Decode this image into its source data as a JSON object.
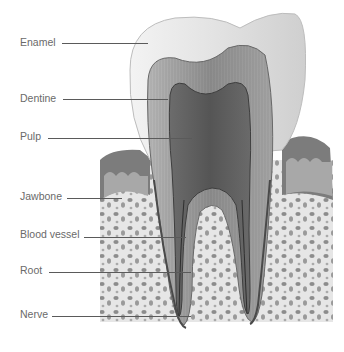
{
  "diagram": {
    "labels": [
      {
        "text": "Enamel",
        "x": 20,
        "y": 36,
        "line_x1": 62,
        "line_x2": 148,
        "line_y": 43
      },
      {
        "text": "Dentine",
        "x": 20,
        "y": 92,
        "line_x1": 63,
        "line_x2": 168,
        "line_y": 99
      },
      {
        "text": "Pulp",
        "x": 20,
        "y": 130,
        "line_x1": 48,
        "line_x2": 192,
        "line_y": 138
      },
      {
        "text": "Jawbone",
        "x": 20,
        "y": 190,
        "line_x1": 67,
        "line_x2": 122,
        "line_y": 198
      },
      {
        "text": "Blood vessel",
        "x": 20,
        "y": 228,
        "line_x1": 84,
        "line_x2": 186,
        "line_y": 237
      },
      {
        "text": "Root",
        "x": 20,
        "y": 264,
        "line_x1": 49,
        "line_x2": 191,
        "line_y": 272
      },
      {
        "text": "Nerve",
        "x": 20,
        "y": 308,
        "line_x1": 52,
        "line_x2": 191,
        "line_y": 316
      }
    ],
    "colors": {
      "label_text": "#6a6a6a",
      "leader_line": "#5a5a5a",
      "enamel": "#ececec",
      "dentine": "#9a9a9a",
      "pulp": "#5e5e5e",
      "gum": "#7a7a7a",
      "bone": "#e4e4e4"
    }
  }
}
